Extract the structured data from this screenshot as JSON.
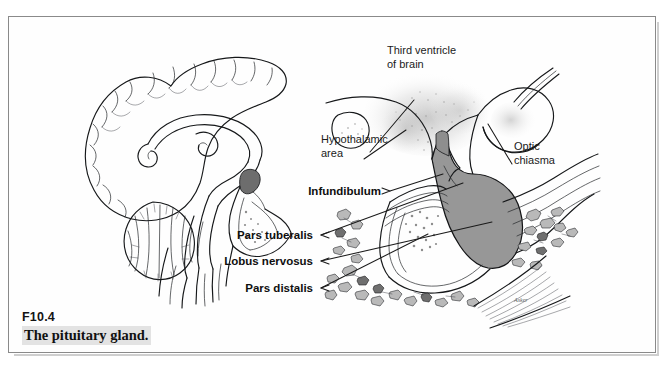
{
  "figure": {
    "number": "F10.4",
    "caption": "The pituitary gland."
  },
  "diagram": {
    "title_semantic": "pituitary-gland-anatomy",
    "labels": {
      "third_ventricle_line1": "Third ventricle",
      "third_ventricle_line2": "of brain",
      "hypothalamic_line1": "Hypothalamic",
      "hypothalamic_line2": "area",
      "optic_chiasma_line1": "Optic",
      "optic_chiasma_line2": "chiasma",
      "infundibulum": "Infundibulum",
      "pars_tuberalis": "Pars tuberalis",
      "lobus_nervosus": "Lobus nervosus",
      "pars_distalis": "Pars distalis"
    },
    "artist_signature": "Asker",
    "colors": {
      "ink": "#16181a",
      "posterior_lobe_fill": "#979797",
      "bone_chip_fill": "#b9b9b9",
      "caption_highlight": "#e3e3e3",
      "frame_border": "#8a8a8a",
      "page_background": "#ffffff"
    }
  }
}
